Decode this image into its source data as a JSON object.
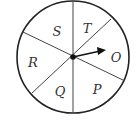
{
  "diagram": {
    "type": "spinner",
    "center": [
      73,
      57
    ],
    "radius": 56,
    "stroke_color": "#222222",
    "sectors": [
      {
        "label": "S",
        "x": 57,
        "y": 36
      },
      {
        "label": "T",
        "x": 87,
        "y": 33
      },
      {
        "label": "O",
        "x": 115,
        "y": 62
      },
      {
        "label": "P",
        "x": 97,
        "y": 94
      },
      {
        "label": "Q",
        "x": 60,
        "y": 96
      },
      {
        "label": "R",
        "x": 33,
        "y": 67
      }
    ],
    "arrow": {
      "from": [
        73,
        57
      ],
      "to": [
        105,
        50
      ]
    }
  }
}
